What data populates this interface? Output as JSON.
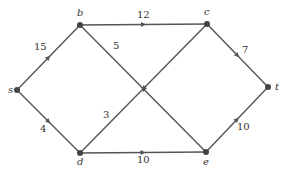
{
  "colors": {
    "edge": "#555555",
    "node": "#444444",
    "text": "#333333",
    "background": "#ffffff"
  },
  "nodes": [
    {
      "id": "s",
      "label": "s",
      "x": 17,
      "y": 90,
      "lx": 8,
      "ly": 93
    },
    {
      "id": "b",
      "label": "b",
      "x": 80,
      "y": 25,
      "lx": 77,
      "ly": 16
    },
    {
      "id": "c",
      "label": "c",
      "x": 207,
      "y": 24,
      "lx": 204,
      "ly": 15
    },
    {
      "id": "t",
      "label": "t",
      "x": 268,
      "y": 87,
      "lx": 275,
      "ly": 90
    },
    {
      "id": "d",
      "label": "d",
      "x": 80,
      "y": 153,
      "lx": 77,
      "ly": 165
    },
    {
      "id": "e",
      "label": "e",
      "x": 206,
      "y": 152,
      "lx": 203,
      "ly": 165
    }
  ],
  "edges": [
    {
      "from": "s",
      "to": "b",
      "weight": "15",
      "lx": 34,
      "ly": 50
    },
    {
      "from": "s",
      "to": "d",
      "weight": "4",
      "lx": 40,
      "ly": 132
    },
    {
      "from": "b",
      "to": "c",
      "weight": "12",
      "lx": 137,
      "ly": 18
    },
    {
      "from": "e",
      "to": "b",
      "weight": "5",
      "lx": 113,
      "ly": 49
    },
    {
      "from": "c",
      "to": "d",
      "weight": "3",
      "lx": 103,
      "ly": 118
    },
    {
      "from": "c",
      "to": "t",
      "weight": "7",
      "lx": 242,
      "ly": 53
    },
    {
      "from": "d",
      "to": "e",
      "weight": "10",
      "lx": 137,
      "ly": 163
    },
    {
      "from": "e",
      "to": "t",
      "weight": "10",
      "lx": 237,
      "ly": 130
    }
  ]
}
